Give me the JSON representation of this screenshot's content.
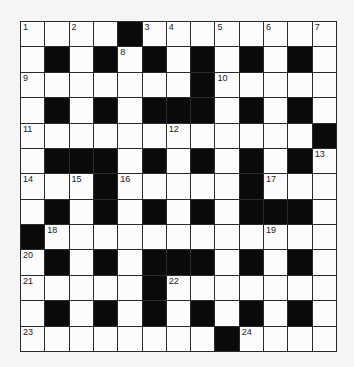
{
  "puzzle": {
    "rows": 13,
    "cols": 13,
    "colors": {
      "background": "#f5f5f5",
      "cell": "#fcfcfc",
      "block": "#0a0a0a",
      "line": "#2a2a2a"
    },
    "layout": [
      "....#........",
      ".#.#.#.#.#.#.",
      ".......#.....",
      ".#.#.###.#.#.",
      "............#",
      ".###.#.#.#.#.",
      "...#.....#...",
      ".#.#.#.#.###.",
      "#............",
      ".#.#.###.#.#.",
      ".....#.......",
      ".#.#.#.#.#.#.",
      "........#...."
    ],
    "numbers": [
      {
        "r": 0,
        "c": 0,
        "n": "1"
      },
      {
        "r": 0,
        "c": 2,
        "n": "2"
      },
      {
        "r": 0,
        "c": 5,
        "n": "3"
      },
      {
        "r": 0,
        "c": 6,
        "n": "4"
      },
      {
        "r": 0,
        "c": 8,
        "n": "5"
      },
      {
        "r": 0,
        "c": 10,
        "n": "6"
      },
      {
        "r": 0,
        "c": 12,
        "n": "7"
      },
      {
        "r": 1,
        "c": 4,
        "n": "8"
      },
      {
        "r": 2,
        "c": 0,
        "n": "9"
      },
      {
        "r": 2,
        "c": 8,
        "n": "10"
      },
      {
        "r": 4,
        "c": 0,
        "n": "11"
      },
      {
        "r": 4,
        "c": 6,
        "n": "12"
      },
      {
        "r": 5,
        "c": 12,
        "n": "13"
      },
      {
        "r": 6,
        "c": 0,
        "n": "14"
      },
      {
        "r": 6,
        "c": 2,
        "n": "15"
      },
      {
        "r": 6,
        "c": 4,
        "n": "16"
      },
      {
        "r": 6,
        "c": 10,
        "n": "17"
      },
      {
        "r": 8,
        "c": 1,
        "n": "18"
      },
      {
        "r": 8,
        "c": 10,
        "n": "19"
      },
      {
        "r": 9,
        "c": 0,
        "n": "20"
      },
      {
        "r": 10,
        "c": 0,
        "n": "21"
      },
      {
        "r": 10,
        "c": 6,
        "n": "22"
      },
      {
        "r": 12,
        "c": 0,
        "n": "23"
      },
      {
        "r": 12,
        "c": 9,
        "n": "24"
      }
    ]
  }
}
